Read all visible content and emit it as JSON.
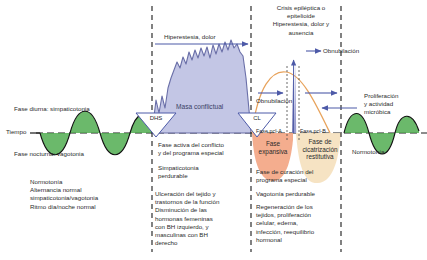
{
  "diagram": {
    "title_hidden": "Esquema de las dos fases de la enfermedad",
    "axis": {
      "time_label": "Tiempo"
    },
    "colors": {
      "normotonia_green": "#4aa94a",
      "conflict_purple": "#b9bce0",
      "conflict_stroke": "#6a6fa8",
      "expansive_orange": "#f3a684",
      "restitutive_cream": "#f6e2c0",
      "arrow_blue": "#4d5aa8",
      "curve_orange": "#e8a35c",
      "dashed_black": "#1a1a1a"
    },
    "markers": [
      {
        "id": "dhs",
        "label": "DHS"
      },
      {
        "id": "cl",
        "label": "CL"
      }
    ],
    "top_labels": {
      "hiperestesia": "Hiperestesia, dolor",
      "crisis": "Crisis epiléptica o\nepitelioide\nHiperestesia, dolor y\nausencia",
      "obnubilacion_top": "Obnubilación",
      "obnubilacion_left": "Obnubilación",
      "proliferacion": "Proliferación\ny actividad\nmicróbica"
    },
    "wave_labels": {
      "diurna": "Fase diurna: simpaticotonia",
      "nocturna": "Fase nocturna: vagotonia",
      "normotonia_right": "Normotonía"
    },
    "conflict_mass_label": "Masa conflictual",
    "pcl_labels": {
      "a": "Fase pcl-A",
      "b": "Fase pcl-B"
    },
    "phase_boxes": [
      {
        "id": "expansiva",
        "label": "Fase\nexpansiva",
        "color": "#f3a684"
      },
      {
        "id": "restitutiva",
        "label": "Fase de\ncicatrización\nrestitutiva",
        "color": "#f6e2c0"
      }
    ],
    "columns": {
      "left": {
        "block_1": "Normotonía\nAlternancia normal\nsimpaticotonia/vagotonia\nRitmo día/noche normal"
      },
      "middle": {
        "block_1": "Fase activa del conflicto\ny del programa especial",
        "block_2": "Simpaticotonia\nperdurable",
        "block_3": "Ulceración del tejido y\ntrastornos de la función\nDisminución de las\nhormonas femeninas\ncon BH izquierdo, y\nmasculinas con BH\nderecho"
      },
      "right": {
        "block_1": "Fase de curación del\nprograma especial",
        "block_2": "Vagotonía perdurable",
        "block_3": "Regeneración de los\ntejidos, proliferación\ncelular, edema,\ninfección, reequilibrio\nhormonal"
      }
    }
  }
}
